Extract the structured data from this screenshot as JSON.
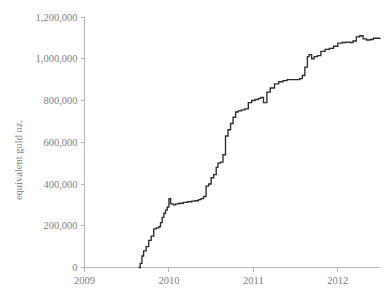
{
  "chart_data": {
    "type": "line",
    "title": "",
    "subtitle": "",
    "xlabel": "",
    "ylabel": "equivalent gold oz.",
    "xlim": [
      2009.0,
      2012.5
    ],
    "ylim": [
      0,
      1200000
    ],
    "grid": false,
    "legend": false,
    "legend_position": "none",
    "x_tick_labels": [
      "2009",
      "2010",
      "2011",
      "2012"
    ],
    "x_ticks": [
      2009,
      2010,
      2011,
      2012
    ],
    "y_tick_labels": [
      "0",
      "200,000",
      "400,000",
      "600,000",
      "800,000",
      "1,000,000",
      "1,200,000"
    ],
    "y_ticks": [
      0,
      200000,
      400000,
      600000,
      800000,
      1000000,
      1200000
    ],
    "line_color": "#2b2b2b",
    "axis_color": "#b7b7b7",
    "tick_label_color": "#808080",
    "series": [
      {
        "name": "cumulative equivalent gold oz.",
        "x": [
          2009.64,
          2009.66,
          2009.68,
          2009.7,
          2009.73,
          2009.76,
          2009.79,
          2009.82,
          2009.85,
          2009.88,
          2009.9,
          2009.92,
          2009.94,
          2009.96,
          2009.98,
          2010.0,
          2010.02,
          2010.05,
          2010.08,
          2010.12,
          2010.17,
          2010.22,
          2010.27,
          2010.31,
          2010.35,
          2010.38,
          2010.41,
          2010.44,
          2010.47,
          2010.5,
          2010.53,
          2010.56,
          2010.58,
          2010.61,
          2010.64,
          2010.67,
          2010.7,
          2010.73,
          2010.76,
          2010.79,
          2010.82,
          2010.86,
          2010.9,
          2010.94,
          2010.98,
          2011.02,
          2011.06,
          2011.09,
          2011.12,
          2011.16,
          2011.2,
          2011.25,
          2011.3,
          2011.35,
          2011.4,
          2011.45,
          2011.5,
          2011.55,
          2011.58,
          2011.61,
          2011.64,
          2011.66,
          2011.69,
          2011.72,
          2011.76,
          2011.8,
          2011.85,
          2011.9,
          2011.95,
          2012.0,
          2012.05,
          2012.1,
          2012.14,
          2012.18,
          2012.22,
          2012.26,
          2012.3,
          2012.34,
          2012.38,
          2012.42,
          2012.46,
          2012.5
        ],
        "y": [
          0,
          20000,
          55000,
          80000,
          100000,
          130000,
          150000,
          185000,
          190000,
          195000,
          215000,
          240000,
          260000,
          275000,
          290000,
          330000,
          305000,
          300000,
          305000,
          308000,
          312000,
          315000,
          318000,
          320000,
          325000,
          330000,
          340000,
          390000,
          400000,
          430000,
          445000,
          480000,
          500000,
          505000,
          540000,
          630000,
          660000,
          690000,
          720000,
          745000,
          750000,
          755000,
          760000,
          790000,
          800000,
          805000,
          810000,
          815000,
          790000,
          840000,
          860000,
          880000,
          890000,
          895000,
          900000,
          900000,
          900000,
          905000,
          920000,
          960000,
          1010000,
          1020000,
          1000000,
          1010000,
          1015000,
          1035000,
          1045000,
          1050000,
          1060000,
          1075000,
          1078000,
          1080000,
          1078000,
          1085000,
          1105000,
          1110000,
          1095000,
          1090000,
          1092000,
          1098000,
          1098000,
          1100000
        ]
      }
    ]
  },
  "axes": {
    "y_axis_title": "equivalent gold oz."
  }
}
